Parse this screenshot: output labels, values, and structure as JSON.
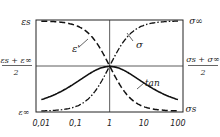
{
  "chart_data": {
    "type": "line",
    "title": "",
    "xscale": "log",
    "xlim": [
      0.007,
      140
    ],
    "x_ticks": [
      {
        "value": 0.01,
        "label": "0,01"
      },
      {
        "value": 0.1,
        "label": "0,1"
      },
      {
        "value": 1,
        "label": "1"
      },
      {
        "value": 10,
        "label": "10"
      },
      {
        "value": 100,
        "label": "100"
      }
    ],
    "left_labels": {
      "top": "ε_s",
      "mid_num": "ε_s + ε_∞",
      "mid_den": "2",
      "bottom": "ε_∞"
    },
    "right_labels": {
      "top": "σ_∞",
      "mid_num": "σ_s + σ_∞",
      "mid_den": "2",
      "bottom": "σ_s"
    },
    "ylim": [
      0,
      1
    ],
    "reference_lines": {
      "x": 1,
      "y": 0.5
    },
    "series": [
      {
        "name": "ε'",
        "label": "ε'",
        "style": "dashed",
        "description": "decreasing sigmoid from top to bottom",
        "x": [
          0.01,
          0.1,
          0.3,
          1,
          3,
          10,
          100
        ],
        "y": [
          0.995,
          0.95,
          0.8,
          0.5,
          0.2,
          0.05,
          0.005
        ]
      },
      {
        "name": "σ",
        "label": "σ",
        "style": "dash-dot",
        "description": "increasing sigmoid from bottom to top",
        "x": [
          0.01,
          0.1,
          0.3,
          1,
          3,
          10,
          100
        ],
        "y": [
          0.005,
          0.05,
          0.2,
          0.5,
          0.8,
          0.95,
          0.995
        ]
      },
      {
        "name": "tan",
        "label": "tan",
        "style": "solid",
        "description": "peak at x=1",
        "x": [
          0.01,
          0.03,
          0.1,
          0.3,
          1,
          3,
          10,
          30,
          100
        ],
        "y": [
          0.04,
          0.1,
          0.22,
          0.41,
          0.5,
          0.41,
          0.22,
          0.1,
          0.04
        ]
      }
    ]
  }
}
